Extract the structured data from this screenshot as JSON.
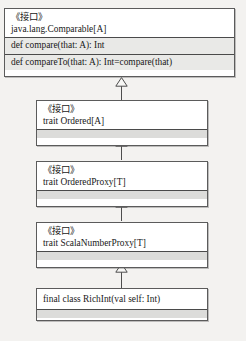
{
  "diagram": {
    "kind": "uml-class-diagram",
    "stereotype_label": "《接口》",
    "relationship": "generalization",
    "colors": {
      "canvas": "#f3f2f0",
      "box_fill": "#ffffff",
      "member_fill": "#e9e9e7",
      "empty_fill": "#dcdcda",
      "border": "#5b5b5b",
      "text": "#191919"
    },
    "classes": [
      {
        "id": "comparable",
        "stereotype": "《接口》",
        "name": "java.lang.Comparable[A]",
        "members": [
          "def compare(that: A): Int",
          "def compareTo(that: A): Int=compare(that)"
        ]
      },
      {
        "id": "ordered",
        "stereotype": "《接口》",
        "name": "trait Ordered[A]",
        "members": []
      },
      {
        "id": "ordered-proxy",
        "stereotype": "《接口》",
        "name": "trait OrderedProxy[T]",
        "members": []
      },
      {
        "id": "scala-number-proxy",
        "stereotype": "《接口》",
        "name": "trait ScalaNumberProxy[T]",
        "members": []
      },
      {
        "id": "rich-int",
        "stereotype": "",
        "name": "final class RichInt(val self: Int)",
        "members": []
      }
    ],
    "edges": [
      {
        "from": "ordered",
        "to": "comparable",
        "type": "generalization"
      },
      {
        "from": "ordered-proxy",
        "to": "ordered",
        "type": "generalization"
      },
      {
        "from": "scala-number-proxy",
        "to": "ordered-proxy",
        "type": "generalization"
      },
      {
        "from": "rich-int",
        "to": "scala-number-proxy",
        "type": "generalization"
      }
    ]
  }
}
